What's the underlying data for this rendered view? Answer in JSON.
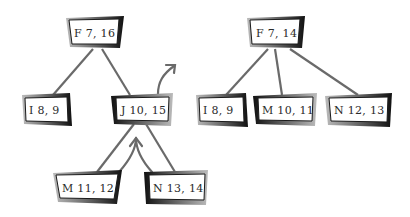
{
  "diagram": {
    "type": "tree-rotation",
    "colors": {
      "background": "#ffffff",
      "edge": "#6a6a6a",
      "box_border": "#1a1a1a",
      "box_shadow": "#5a5a5a",
      "text": "#2a2a2a"
    },
    "left_tree": {
      "root": {
        "label": "F 7, 16"
      },
      "children": [
        {
          "label": "I 8, 9"
        },
        {
          "label": "J 10, 15",
          "children": [
            {
              "label": "M 11, 12"
            },
            {
              "label": "N 13, 14"
            }
          ]
        }
      ],
      "arrows": [
        {
          "name": "up-right-arrow",
          "description": "curved arrow leaving J node upward"
        },
        {
          "name": "up-arrow",
          "description": "curved arrow between M and N pointing up into J"
        }
      ]
    },
    "right_tree": {
      "root": {
        "label": "F 7, 14"
      },
      "children": [
        {
          "label": "I 8, 9"
        },
        {
          "label": "M 10, 11"
        },
        {
          "label": "N 12, 13"
        }
      ]
    }
  }
}
